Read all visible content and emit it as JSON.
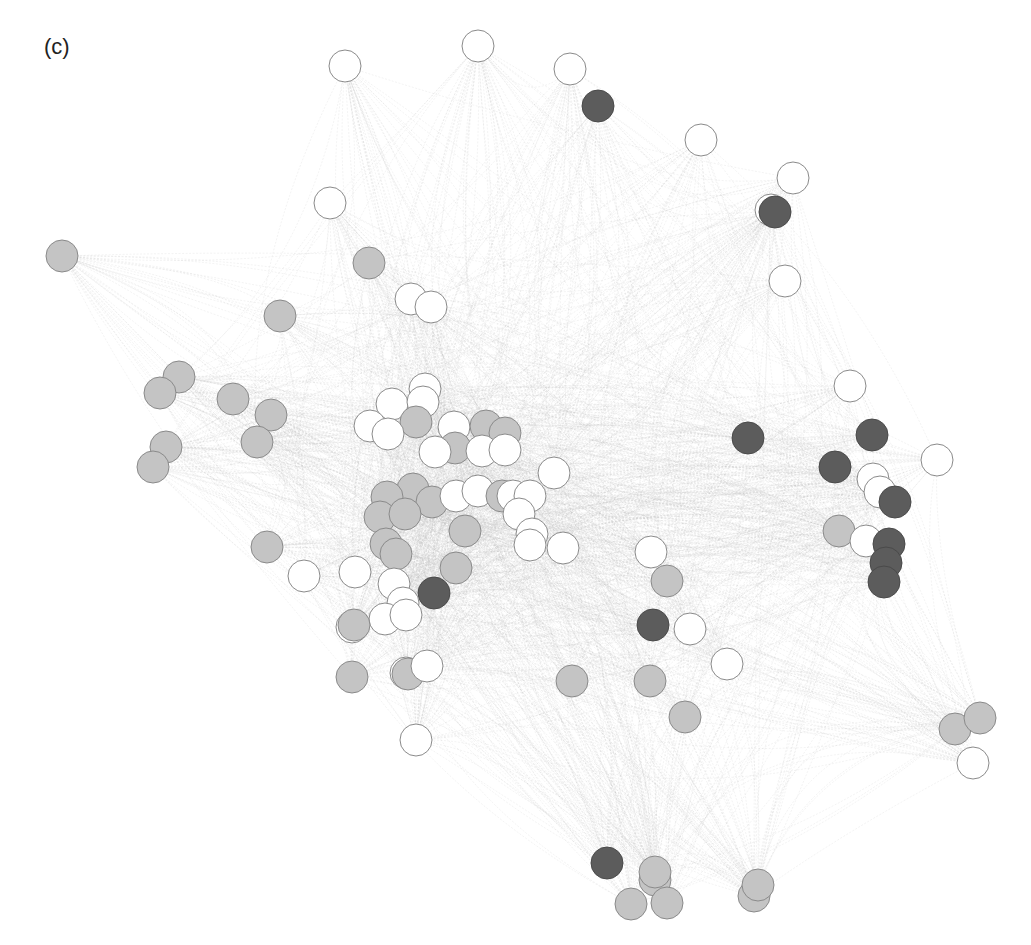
{
  "panel_label": "(c)",
  "colors": {
    "white": "#ffffff",
    "light": "#c4c4c4",
    "dark": "#5c5c5c",
    "stroke": "#8a8a8a",
    "edge": "#b8b8b8"
  },
  "node_radius": 16,
  "nodes": [
    {
      "x": 478,
      "y": 46,
      "c": "white"
    },
    {
      "x": 345,
      "y": 66,
      "c": "white"
    },
    {
      "x": 570,
      "y": 69,
      "c": "white"
    },
    {
      "x": 598,
      "y": 106,
      "c": "dark"
    },
    {
      "x": 701,
      "y": 140,
      "c": "white"
    },
    {
      "x": 793,
      "y": 178,
      "c": "white"
    },
    {
      "x": 771,
      "y": 210,
      "c": "white"
    },
    {
      "x": 775,
      "y": 212,
      "c": "dark"
    },
    {
      "x": 330,
      "y": 203,
      "c": "white"
    },
    {
      "x": 62,
      "y": 256,
      "c": "light"
    },
    {
      "x": 369,
      "y": 263,
      "c": "light"
    },
    {
      "x": 785,
      "y": 281,
      "c": "white"
    },
    {
      "x": 411,
      "y": 299,
      "c": "white"
    },
    {
      "x": 431,
      "y": 307,
      "c": "white"
    },
    {
      "x": 280,
      "y": 316,
      "c": "light"
    },
    {
      "x": 179,
      "y": 377,
      "c": "light"
    },
    {
      "x": 160,
      "y": 393,
      "c": "light"
    },
    {
      "x": 233,
      "y": 399,
      "c": "light"
    },
    {
      "x": 271,
      "y": 415,
      "c": "light"
    },
    {
      "x": 257,
      "y": 442,
      "c": "light"
    },
    {
      "x": 166,
      "y": 447,
      "c": "light"
    },
    {
      "x": 153,
      "y": 467,
      "c": "light"
    },
    {
      "x": 850,
      "y": 386,
      "c": "white"
    },
    {
      "x": 748,
      "y": 438,
      "c": "dark"
    },
    {
      "x": 872,
      "y": 435,
      "c": "dark"
    },
    {
      "x": 835,
      "y": 467,
      "c": "dark"
    },
    {
      "x": 937,
      "y": 460,
      "c": "white"
    },
    {
      "x": 873,
      "y": 479,
      "c": "white"
    },
    {
      "x": 880,
      "y": 492,
      "c": "white"
    },
    {
      "x": 895,
      "y": 502,
      "c": "dark"
    },
    {
      "x": 839,
      "y": 531,
      "c": "light"
    },
    {
      "x": 866,
      "y": 541,
      "c": "white"
    },
    {
      "x": 889,
      "y": 544,
      "c": "dark"
    },
    {
      "x": 886,
      "y": 563,
      "c": "dark"
    },
    {
      "x": 884,
      "y": 582,
      "c": "dark"
    },
    {
      "x": 425,
      "y": 389,
      "c": "white"
    },
    {
      "x": 392,
      "y": 404,
      "c": "white"
    },
    {
      "x": 423,
      "y": 402,
      "c": "white"
    },
    {
      "x": 370,
      "y": 426,
      "c": "white"
    },
    {
      "x": 416,
      "y": 422,
      "c": "light"
    },
    {
      "x": 454,
      "y": 427,
      "c": "white"
    },
    {
      "x": 486,
      "y": 426,
      "c": "light"
    },
    {
      "x": 388,
      "y": 434,
      "c": "white"
    },
    {
      "x": 505,
      "y": 433,
      "c": "light"
    },
    {
      "x": 455,
      "y": 448,
      "c": "light"
    },
    {
      "x": 435,
      "y": 452,
      "c": "white"
    },
    {
      "x": 482,
      "y": 451,
      "c": "white"
    },
    {
      "x": 505,
      "y": 450,
      "c": "white"
    },
    {
      "x": 554,
      "y": 473,
      "c": "white"
    },
    {
      "x": 413,
      "y": 489,
      "c": "light"
    },
    {
      "x": 387,
      "y": 497,
      "c": "light"
    },
    {
      "x": 432,
      "y": 502,
      "c": "light"
    },
    {
      "x": 456,
      "y": 496,
      "c": "white"
    },
    {
      "x": 478,
      "y": 491,
      "c": "white"
    },
    {
      "x": 502,
      "y": 496,
      "c": "light"
    },
    {
      "x": 513,
      "y": 496,
      "c": "white"
    },
    {
      "x": 530,
      "y": 496,
      "c": "white"
    },
    {
      "x": 380,
      "y": 517,
      "c": "light"
    },
    {
      "x": 405,
      "y": 514,
      "c": "light"
    },
    {
      "x": 465,
      "y": 531,
      "c": "light"
    },
    {
      "x": 519,
      "y": 514,
      "c": "white"
    },
    {
      "x": 532,
      "y": 534,
      "c": "white"
    },
    {
      "x": 530,
      "y": 545,
      "c": "white"
    },
    {
      "x": 563,
      "y": 548,
      "c": "white"
    },
    {
      "x": 386,
      "y": 544,
      "c": "light"
    },
    {
      "x": 396,
      "y": 554,
      "c": "light"
    },
    {
      "x": 267,
      "y": 547,
      "c": "light"
    },
    {
      "x": 304,
      "y": 576,
      "c": "white"
    },
    {
      "x": 355,
      "y": 572,
      "c": "white"
    },
    {
      "x": 456,
      "y": 568,
      "c": "light"
    },
    {
      "x": 394,
      "y": 584,
      "c": "white"
    },
    {
      "x": 434,
      "y": 593,
      "c": "dark"
    },
    {
      "x": 403,
      "y": 603,
      "c": "white"
    },
    {
      "x": 385,
      "y": 619,
      "c": "white"
    },
    {
      "x": 406,
      "y": 615,
      "c": "white"
    },
    {
      "x": 352,
      "y": 627,
      "c": "white"
    },
    {
      "x": 354,
      "y": 625,
      "c": "light"
    },
    {
      "x": 352,
      "y": 677,
      "c": "light"
    },
    {
      "x": 406,
      "y": 673,
      "c": "white"
    },
    {
      "x": 408,
      "y": 674,
      "c": "light"
    },
    {
      "x": 427,
      "y": 666,
      "c": "white"
    },
    {
      "x": 416,
      "y": 740,
      "c": "white"
    },
    {
      "x": 651,
      "y": 552,
      "c": "white"
    },
    {
      "x": 667,
      "y": 581,
      "c": "light"
    },
    {
      "x": 653,
      "y": 625,
      "c": "dark"
    },
    {
      "x": 690,
      "y": 629,
      "c": "white"
    },
    {
      "x": 727,
      "y": 664,
      "c": "white"
    },
    {
      "x": 572,
      "y": 681,
      "c": "light"
    },
    {
      "x": 650,
      "y": 681,
      "c": "light"
    },
    {
      "x": 685,
      "y": 717,
      "c": "light"
    },
    {
      "x": 955,
      "y": 729,
      "c": "light"
    },
    {
      "x": 980,
      "y": 718,
      "c": "light"
    },
    {
      "x": 973,
      "y": 763,
      "c": "white"
    },
    {
      "x": 607,
      "y": 863,
      "c": "dark"
    },
    {
      "x": 655,
      "y": 880,
      "c": "light"
    },
    {
      "x": 655,
      "y": 872,
      "c": "light"
    },
    {
      "x": 631,
      "y": 904,
      "c": "light"
    },
    {
      "x": 667,
      "y": 903,
      "c": "light"
    },
    {
      "x": 754,
      "y": 896,
      "c": "light"
    },
    {
      "x": 758,
      "y": 885,
      "c": "light"
    }
  ]
}
